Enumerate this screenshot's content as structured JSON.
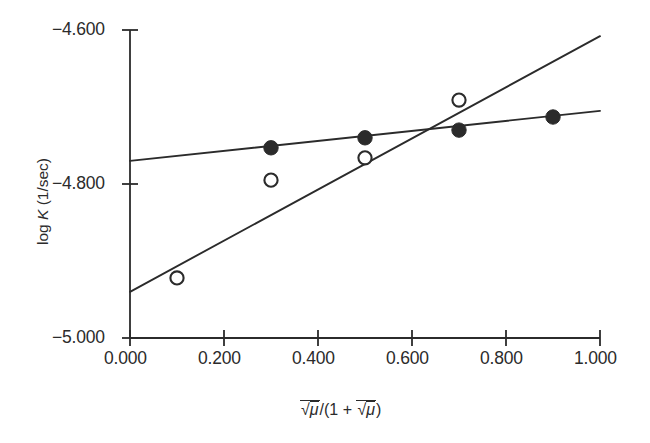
{
  "chart_data": {
    "type": "scatter",
    "title": "",
    "xlabel": "sqrt(mu-bar)/(1 + sqrt(mu-bar))",
    "ylabel": "log K (1/sec)",
    "xlim": [
      0.0,
      1.0
    ],
    "ylim": [
      -5.0,
      -4.6
    ],
    "grid": false,
    "legend_position": "none",
    "x_tick_labels": [
      "0.000",
      "0.200",
      "0.400",
      "0.600",
      "0.800",
      "1.000"
    ],
    "x_tick_values": [
      0.0,
      0.2,
      0.4,
      0.6,
      0.8,
      1.0
    ],
    "y_tick_labels": [
      "-4.600",
      "-4.800",
      "-5.000"
    ],
    "y_tick_values": [
      -4.6,
      -4.8,
      -5.0
    ],
    "series": [
      {
        "name": "filled-circles",
        "marker": "filled-circle",
        "color": "#2b2b2b",
        "x": [
          0.3,
          0.5,
          0.7,
          0.9
        ],
        "y": [
          -4.753,
          -4.74,
          -4.73,
          -4.713
        ]
      },
      {
        "name": "open-circles",
        "marker": "open-circle",
        "color": "#2b2b2b",
        "x": [
          0.1,
          0.3,
          0.5,
          0.7
        ],
        "y": [
          -4.922,
          -4.795,
          -4.766,
          -4.691
        ]
      }
    ],
    "fit_lines": [
      {
        "name": "shallow-fit-line",
        "for_series": "filled-circles",
        "x": [
          0.0,
          1.0
        ],
        "y": [
          -4.77,
          -4.705
        ]
      },
      {
        "name": "steep-fit-line",
        "for_series": "open-circles",
        "x": [
          0.0,
          1.0
        ],
        "y": [
          -4.94,
          -4.608
        ]
      }
    ]
  },
  "axes": {
    "y_label_parts": {
      "pre": "log ",
      "symbol": "K",
      "post": " (1/sec)"
    },
    "x_label_parts": {
      "radical": "√",
      "mu": "μ",
      "open": "/(1 + ",
      "close": ")"
    },
    "y_ticks": [
      {
        "label": "-4.600",
        "value": -4.6
      },
      {
        "label": "-4.800",
        "value": -4.8
      },
      {
        "label": "-5.000",
        "value": -5.0
      }
    ],
    "x_ticks": [
      {
        "label": "0.000",
        "value": 0.0
      },
      {
        "label": "0.200",
        "value": 0.2
      },
      {
        "label": "0.400",
        "value": 0.4
      },
      {
        "label": "0.600",
        "value": 0.6
      },
      {
        "label": "0.800",
        "value": 0.8
      },
      {
        "label": "1.000",
        "value": 1.0
      }
    ]
  },
  "style": {
    "axis_color": "#2b2b2b",
    "marker_color": "#2b2b2b",
    "line_color": "#2b2b2b",
    "background": "#ffffff"
  }
}
